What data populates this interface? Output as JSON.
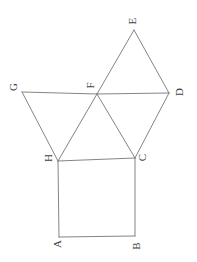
{
  "diagram": {
    "type": "geometry-figure",
    "background_color": "#ffffff",
    "line_color": "#767676",
    "line_width": 0.9,
    "label_color": "#3d3d3d",
    "label_rotation_deg": -90,
    "label_font_size": 11,
    "canvas": {
      "width": 197,
      "height": 262
    },
    "vertices": [
      {
        "id": "A",
        "x": 59,
        "y": 237,
        "label": "A",
        "lx": 56.5,
        "ly": 244
      },
      {
        "id": "B",
        "x": 135,
        "y": 236,
        "label": "B",
        "lx": 135.5,
        "ly": 246
      },
      {
        "id": "C",
        "x": 135,
        "y": 158,
        "label": "C",
        "lx": 142,
        "ly": 157.5
      },
      {
        "id": "H",
        "x": 58,
        "y": 161,
        "label": "H",
        "lx": 47.5,
        "ly": 158
      },
      {
        "id": "F",
        "x": 97,
        "y": 94,
        "label": "F",
        "lx": 90,
        "ly": 85.5
      },
      {
        "id": "G",
        "x": 22,
        "y": 92,
        "label": "G",
        "lx": 12.5,
        "ly": 87
      },
      {
        "id": "D",
        "x": 169,
        "y": 93,
        "label": "D",
        "lx": 179,
        "ly": 92
      },
      {
        "id": "E",
        "x": 134,
        "y": 30,
        "label": "E",
        "lx": 132,
        "ly": 21
      }
    ],
    "edges": [
      [
        "A",
        "B"
      ],
      [
        "B",
        "C"
      ],
      [
        "C",
        "H"
      ],
      [
        "H",
        "A"
      ],
      [
        "G",
        "H"
      ],
      [
        "G",
        "F"
      ],
      [
        "F",
        "D"
      ],
      [
        "H",
        "F"
      ],
      [
        "F",
        "E"
      ],
      [
        "F",
        "C"
      ],
      [
        "C",
        "D"
      ],
      [
        "D",
        "E"
      ]
    ]
  }
}
